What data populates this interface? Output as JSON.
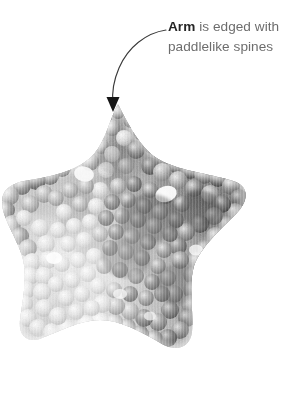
{
  "figure": {
    "background_color": "#ffffff"
  },
  "callout": {
    "term": "Arm",
    "rest": " is edged with paddlelike spines",
    "full_text": "Arm is edged with paddlelike spines",
    "term_color": "#262626",
    "body_color": "#6d6d6d"
  },
  "leader": {
    "line_color": "#3a3a3a",
    "arrow_color": "#1a1a1a",
    "arrow_tip_x": 113,
    "arrow_tip_y": 112,
    "start_x": 166,
    "start_y": 30
  },
  "specimen": {
    "name": "sea-star-photograph",
    "arm_count": 5,
    "texture": "knobby paddlelike spines",
    "tone_dark": "#4a4a4a",
    "tone_mid": "#8f8f8f",
    "tone_light": "#cfcfcf"
  }
}
